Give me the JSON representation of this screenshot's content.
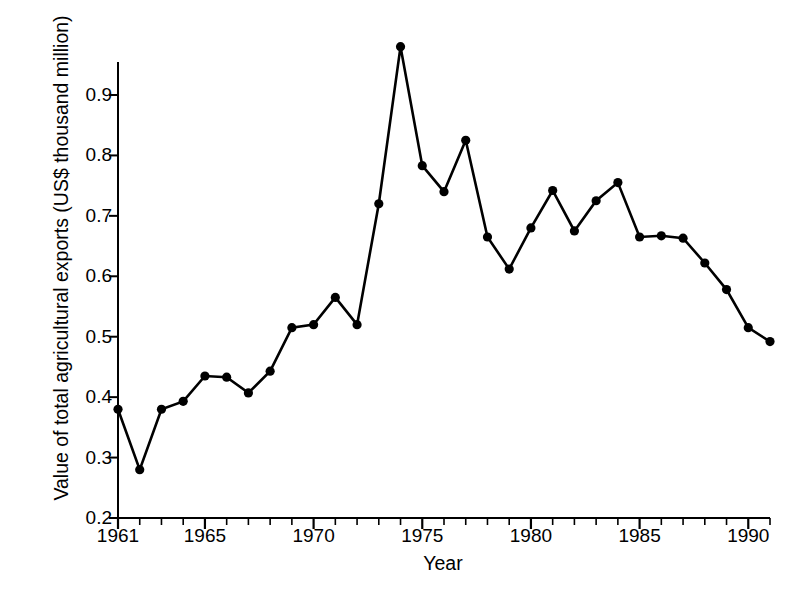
{
  "chart_data": {
    "type": "line",
    "title": "",
    "xlabel": "Year",
    "ylabel": "Value of total agricultural exports (US$ thousand million)",
    "xlim": [
      1961,
      1991
    ],
    "ylim": [
      0.2,
      1.0
    ],
    "grid": false,
    "legend": null,
    "marker": "filled-circle",
    "line_color": "#000000",
    "marker_color": "#000000",
    "x_tick_labels": [
      "1961",
      "1965",
      "1970",
      "1975",
      "1980",
      "1985",
      "1990"
    ],
    "x_tick_values": [
      1961,
      1965,
      1970,
      1975,
      1980,
      1985,
      1990
    ],
    "x_minor_ticks_every": 1,
    "y_tick_labels": [
      "0.2",
      "0.3",
      "0.4",
      "0.5",
      "0.6",
      "0.7",
      "0.8",
      "0.9"
    ],
    "y_tick_values": [
      0.2,
      0.3,
      0.4,
      0.5,
      0.6,
      0.7,
      0.8,
      0.9
    ],
    "x": [
      1961,
      1962,
      1963,
      1964,
      1965,
      1966,
      1967,
      1968,
      1969,
      1970,
      1971,
      1972,
      1973,
      1974,
      1975,
      1976,
      1977,
      1978,
      1979,
      1980,
      1981,
      1982,
      1983,
      1984,
      1985,
      1986,
      1987,
      1988,
      1989,
      1990,
      1991
    ],
    "values": [
      0.38,
      0.28,
      0.38,
      0.393,
      0.435,
      0.433,
      0.407,
      0.443,
      0.515,
      0.52,
      0.565,
      0.52,
      0.72,
      0.98,
      0.783,
      0.74,
      0.825,
      0.665,
      0.612,
      0.68,
      0.742,
      0.675,
      0.725,
      0.755,
      0.665,
      0.667,
      0.663,
      0.622,
      0.578,
      0.515,
      0.492
    ]
  }
}
